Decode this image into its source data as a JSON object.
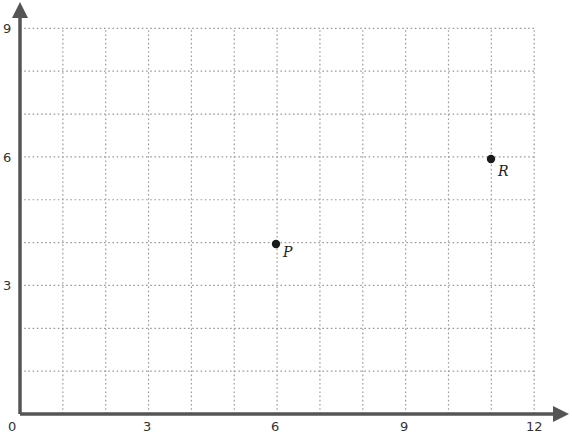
{
  "chart_data": {
    "type": "scatter",
    "title": "",
    "xlabel": "",
    "ylabel": "",
    "xlim": [
      0,
      12
    ],
    "ylim": [
      0,
      9
    ],
    "grid": true,
    "grid_step": 1,
    "x_ticks": [
      0,
      3,
      6,
      9,
      12
    ],
    "y_ticks": [
      3,
      6,
      9
    ],
    "x_tick_labels": [
      "0",
      "3",
      "6",
      "9",
      "12"
    ],
    "y_tick_labels": [
      "3",
      "6",
      "9"
    ],
    "points": [
      {
        "label": "P",
        "x": 6,
        "y": 4
      },
      {
        "label": "R",
        "x": 11,
        "y": 6
      }
    ],
    "legend": null,
    "colors": {
      "axis": "#555555",
      "grid": "#9a9a9a",
      "point": "#1a1a1a"
    }
  },
  "labels": {
    "origin": "0",
    "x3": "3",
    "x6": "6",
    "x9": "9",
    "x12": "12",
    "y3": "3",
    "y6": "6",
    "y9": "9",
    "pointP": "P",
    "pointR": "R"
  }
}
